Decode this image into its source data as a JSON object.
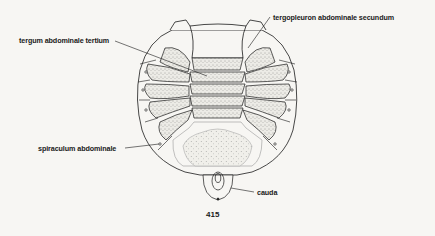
{
  "figure": {
    "number": "415",
    "colors": {
      "ink": "#1a1a1a",
      "stipple_fill": "#d9d7d0",
      "paper": "#f7f6f3"
    }
  },
  "labels": {
    "tergopleuron": "tergopleuron abdominale secundum",
    "tergum": "tergum abdominale tertium",
    "spiraculum": "spiraculum abdominale",
    "cauda": "cauda"
  }
}
